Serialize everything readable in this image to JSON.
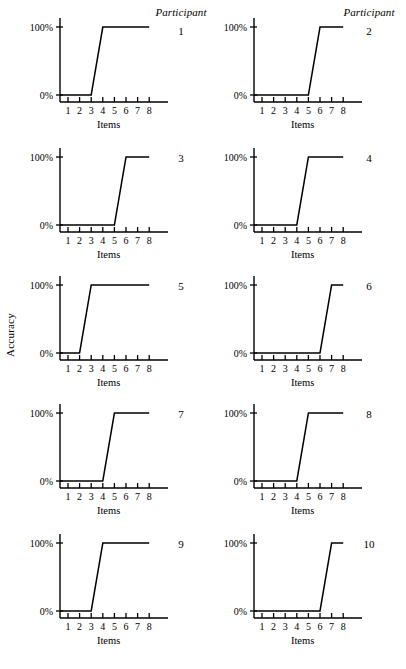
{
  "figure": {
    "y_axis_title": "Accuracy",
    "x_axis_title": "Items",
    "participant_header": "Participant",
    "y_tick_labels": [
      "100%",
      "0%"
    ],
    "x_tick_labels": [
      "1",
      "2",
      "3",
      "4",
      "5",
      "6",
      "7",
      "8"
    ],
    "line_color": "#000000",
    "background_color": "#ffffff"
  },
  "chart_data": {
    "type": "line",
    "title": "",
    "subtitle": "",
    "xlabel": "Items",
    "ylabel": "Accuracy",
    "xlim": [
      1,
      8
    ],
    "ylim": [
      0,
      100
    ],
    "x": [
      1,
      2,
      3,
      4,
      5,
      6,
      7,
      8
    ],
    "xtick_labels": [
      "1",
      "2",
      "3",
      "4",
      "5",
      "6",
      "7",
      "8"
    ],
    "ytick_values": [
      0,
      100
    ],
    "ytick_labels": [
      "0%",
      "100%"
    ],
    "grid": false,
    "legend": "none",
    "panel_layout": {
      "rows": 5,
      "cols": 2,
      "panel_label_prefix": "Participant"
    },
    "series": [
      {
        "name": "1",
        "panel_label": "1",
        "step_from": 3,
        "step_to": 4,
        "values": [
          0,
          0,
          0,
          100,
          100,
          100,
          100,
          100
        ]
      },
      {
        "name": "2",
        "panel_label": "2",
        "step_from": 5,
        "step_to": 6,
        "values": [
          0,
          0,
          0,
          0,
          0,
          100,
          100,
          100
        ]
      },
      {
        "name": "3",
        "panel_label": "3",
        "step_from": 5,
        "step_to": 6,
        "values": [
          0,
          0,
          0,
          0,
          0,
          100,
          100,
          100
        ]
      },
      {
        "name": "4",
        "panel_label": "4",
        "step_from": 4,
        "step_to": 5,
        "values": [
          0,
          0,
          0,
          0,
          100,
          100,
          100,
          100
        ]
      },
      {
        "name": "5",
        "panel_label": "5",
        "step_from": 2,
        "step_to": 3,
        "values": [
          0,
          0,
          100,
          100,
          100,
          100,
          100,
          100
        ]
      },
      {
        "name": "6",
        "panel_label": "6",
        "step_from": 6,
        "step_to": 7,
        "values": [
          0,
          0,
          0,
          0,
          0,
          0,
          100,
          100
        ]
      },
      {
        "name": "7",
        "panel_label": "7",
        "step_from": 4,
        "step_to": 5,
        "values": [
          0,
          0,
          0,
          0,
          100,
          100,
          100,
          100
        ]
      },
      {
        "name": "8",
        "panel_label": "8",
        "step_from": 4,
        "step_to": 5,
        "values": [
          0,
          0,
          0,
          0,
          100,
          100,
          100,
          100
        ]
      },
      {
        "name": "9",
        "panel_label": "9",
        "step_from": 3,
        "step_to": 4,
        "values": [
          0,
          0,
          0,
          100,
          100,
          100,
          100,
          100
        ]
      },
      {
        "name": "10",
        "panel_label": "10",
        "step_from": 6,
        "step_to": 7,
        "values": [
          0,
          0,
          0,
          0,
          0,
          0,
          100,
          100
        ]
      }
    ]
  }
}
